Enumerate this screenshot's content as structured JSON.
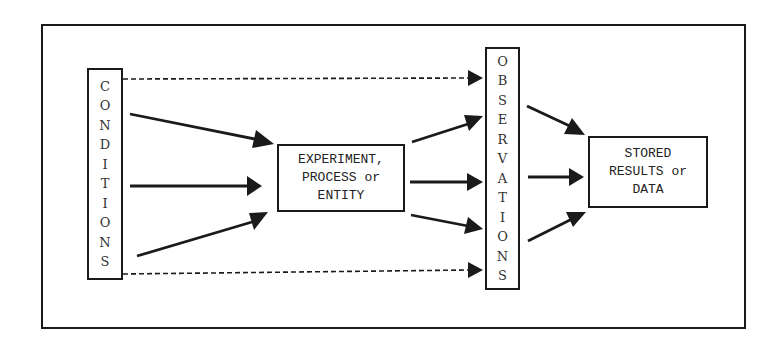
{
  "diagram": {
    "nodes": {
      "conditions": {
        "label": "CONDITIONS",
        "letters": [
          "C",
          "O",
          "N",
          "D",
          "I",
          "T",
          "I",
          "O",
          "N",
          "S"
        ]
      },
      "experiment": {
        "lines": [
          "EXPERIMENT,",
          "PROCESS or",
          "ENTITY"
        ]
      },
      "observations": {
        "label": "OBSERVATIONS",
        "letters": [
          "O",
          "B",
          "S",
          "E",
          "R",
          "V",
          "A",
          "T",
          "I",
          "O",
          "N",
          "S"
        ]
      },
      "stored": {
        "lines": [
          "STORED",
          "RESULTS or",
          "DATA"
        ]
      }
    },
    "edges": [
      {
        "from": "conditions",
        "to": "experiment",
        "style": "solid",
        "count": 3
      },
      {
        "from": "conditions",
        "to": "observations",
        "style": "dashed",
        "count": 2
      },
      {
        "from": "experiment",
        "to": "observations",
        "style": "solid",
        "count": 3
      },
      {
        "from": "observations",
        "to": "stored",
        "style": "solid",
        "count": 3
      }
    ]
  }
}
